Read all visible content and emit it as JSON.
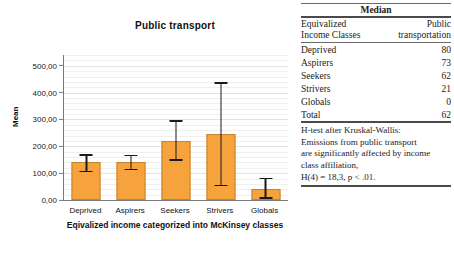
{
  "chart_data": {
    "type": "bar",
    "title": "Public transport",
    "xlabel": "Eqivalized income categorized into McKinsey classes",
    "ylabel": "Mean",
    "categories": [
      "Deprived",
      "Aspirers",
      "Seekers",
      "Strivers",
      "Globals"
    ],
    "values": [
      140,
      140,
      220,
      245,
      42
    ],
    "error_upper": [
      170,
      168,
      297,
      438,
      83
    ],
    "error_lower": [
      103,
      110,
      147,
      52,
      5
    ],
    "ylim": [
      0,
      540
    ],
    "yticks": [
      0,
      100,
      200,
      300,
      400,
      500
    ],
    "ytick_labels": [
      "0,00",
      "100,00",
      "200,00",
      "300,00",
      "400,00",
      "500,00"
    ],
    "grid": true,
    "legend": "none",
    "bar_color": "#F7A33D",
    "bar_border_color": "#C8812F",
    "error_color": "#1a1a1a"
  },
  "chart": {
    "title": "Public transport",
    "y_axis_label": "Mean",
    "x_axis_label": "Eqivalized income categorized into McKinsey classes"
  },
  "table": {
    "caption": "Median",
    "header": {
      "col1_line1": "Equivalized",
      "col1_line2": "Income Classes",
      "col2_line1": "Public",
      "col2_line2": "transportation"
    },
    "rows": [
      {
        "label": "Deprived",
        "value": "80"
      },
      {
        "label": "Aspirers",
        "value": "73"
      },
      {
        "label": "Seekers",
        "value": "62"
      },
      {
        "label": "Strivers",
        "value": "21"
      },
      {
        "label": "Globals",
        "value": "0"
      },
      {
        "label": "Total",
        "value": "62"
      }
    ],
    "note_lines": [
      "H-test after Kruskal-Wallis:",
      "Emissions from public transport",
      "are significantly affected by income",
      "class affiliation,",
      "H(4) = 18,3, p < .01."
    ]
  }
}
